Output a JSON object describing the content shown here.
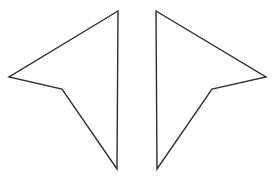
{
  "figure": {
    "background_color": "#fefefe",
    "width": 276,
    "height": 179,
    "stroke_color": "#2f2f33",
    "fill_color": "#ffffff",
    "stroke_width": 1.4,
    "shapes": [
      {
        "name": "left-dart",
        "description": "concave quadrilateral (dart) pointing left",
        "points": "118,11 9,77 62,89 117,169",
        "vertices": [
          {
            "label": "apex-top",
            "x": 118,
            "y": 11
          },
          {
            "label": "outer-tip-left",
            "x": 9,
            "y": 77
          },
          {
            "label": "concave-notch",
            "x": 62,
            "y": 89
          },
          {
            "label": "bottom-point",
            "x": 117,
            "y": 169
          }
        ]
      },
      {
        "name": "right-dart",
        "description": "concave quadrilateral (dart) pointing right, mirror of left",
        "points": "156,11 266,77 212,89 157,169",
        "vertices": [
          {
            "label": "apex-top",
            "x": 156,
            "y": 11
          },
          {
            "label": "outer-tip-right",
            "x": 266,
            "y": 77
          },
          {
            "label": "concave-notch",
            "x": 212,
            "y": 89
          },
          {
            "label": "bottom-point",
            "x": 157,
            "y": 169
          }
        ]
      }
    ]
  }
}
